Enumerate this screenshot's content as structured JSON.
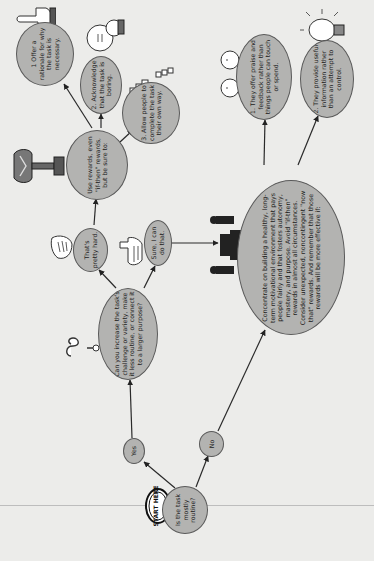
{
  "diagram": {
    "background_color": "#ececea",
    "node_fill": "#b3b3b1",
    "node_stroke": "#5a5a5a",
    "start_badge": "START HERE",
    "nodes": {
      "start": "Is the task mostly routine?",
      "yes": "Yes",
      "no": "No",
      "increase": "Can you increase the task's challenge or variety, make it less routine, or connect it to a larger purpose?",
      "hard": "That's pretty hard.",
      "sure": "Sure, I can do that.",
      "use_rewards": "Use rewards, even \"if-then\" rewards, but be sure to:",
      "offer_rationale": "1 Offer a rationale for why the task is necessary.",
      "acknowledge": "2. Acknowledge that the task is boring.",
      "allow": "3. Allow people to complete the task their own way.",
      "concentrate": "Concentrate on building a healthy, long-term motivational environment that pays people fairly and that fosters autonomy, mastery, and purpose. Avoid \"if-then\" rewards in almost all circumstances. Consider unexpected, noncontingent \"now that\" rewards. And remember that those rewards will be more effective if:",
      "praise": "1. They offer praise and feedback rather than things people can touch or spend.",
      "provide_info": "2. They provide useful information rather than an attempt to control."
    },
    "edges": [
      [
        "start",
        "yes"
      ],
      [
        "start",
        "no"
      ],
      [
        "yes",
        "increase"
      ],
      [
        "no",
        "concentrate"
      ],
      [
        "increase",
        "hard"
      ],
      [
        "increase",
        "sure"
      ],
      [
        "hard",
        "use_rewards"
      ],
      [
        "sure",
        "concentrate"
      ],
      [
        "use_rewards",
        "offer_rationale"
      ],
      [
        "use_rewards",
        "acknowledge"
      ],
      [
        "use_rewards",
        "allow"
      ],
      [
        "concentrate",
        "praise"
      ],
      [
        "concentrate",
        "provide_info"
      ]
    ],
    "icons": [
      "start-here-badge-icon",
      "question-mark-icon",
      "thumbs-down-hand-icon",
      "pointing-hand-icon",
      "trophy-icon",
      "pointing-finger-icon",
      "bored-face-icon",
      "broken-chain-icon",
      "people-at-desk-icon",
      "happy-faces-icon",
      "light-bulb-icon"
    ]
  }
}
